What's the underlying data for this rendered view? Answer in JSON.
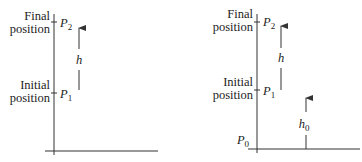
{
  "diagrams": [
    {
      "id": "left",
      "labels": {
        "final_line1": "Final",
        "final_line2": "position",
        "initial_line1": "Initial",
        "initial_line2": "position",
        "p2": "P",
        "p2_sub": "2",
        "p1": "P",
        "p1_sub": "1",
        "h": "h"
      }
    },
    {
      "id": "right",
      "labels": {
        "final_line1": "Final",
        "final_line2": "position",
        "initial_line1": "Initial",
        "initial_line2": "position",
        "p2": "P",
        "p2_sub": "2",
        "p1": "P",
        "p1_sub": "1",
        "p0": "P",
        "p0_sub": "0",
        "h": "h",
        "h0": "h",
        "h0_sub": "0"
      }
    }
  ],
  "colors": {
    "line": "#333333",
    "text": "#222222",
    "background": "#ffffff"
  }
}
